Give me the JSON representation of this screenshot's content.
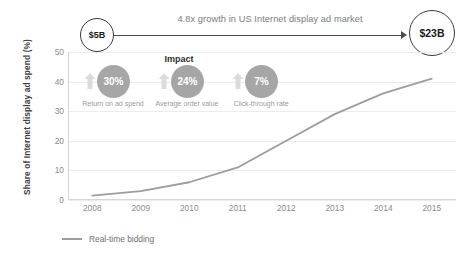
{
  "banner": {
    "start_value": "$5B",
    "end_value": "$23B",
    "growth_label": "4.8x growth in US Internet display ad market"
  },
  "impact": {
    "title": "Impact",
    "items": [
      {
        "value": "30%",
        "caption": "Return on ad spend",
        "icon": "up-arrow-icon"
      },
      {
        "value": "24%",
        "caption": "Average order value",
        "icon": "up-arrow-icon"
      },
      {
        "value": "7%",
        "caption": "Click-through rate",
        "icon": "up-arrow-icon"
      }
    ]
  },
  "legend": {
    "entries": [
      {
        "label": "Real-time bidding",
        "color": "#9d9d9d"
      }
    ]
  },
  "colors": {
    "line": "#9d9d9d",
    "circle_fill": "#a6a6a6",
    "gridline": "#ececec",
    "axis": "#d6d6d6",
    "tick_text": "#8c8c8c"
  },
  "chart_data": {
    "type": "line",
    "title": "",
    "xlabel": "",
    "ylabel": "Share of Internet display ad spend (%)",
    "categories": [
      "2008",
      "2009",
      "2010",
      "2011",
      "2012",
      "2013",
      "2014",
      "2015"
    ],
    "x": [
      2008,
      2009,
      2010,
      2011,
      2012,
      2013,
      2014,
      2015
    ],
    "series": [
      {
        "name": "Real-time bidding",
        "color": "#9d9d9d",
        "values": [
          1.5,
          3,
          6,
          11,
          20,
          29,
          36,
          41
        ]
      }
    ],
    "ylim": [
      0,
      50
    ],
    "yticks": [
      0,
      10,
      20,
      30,
      40,
      50
    ],
    "grid": true,
    "legend_position": "bottom-left"
  }
}
